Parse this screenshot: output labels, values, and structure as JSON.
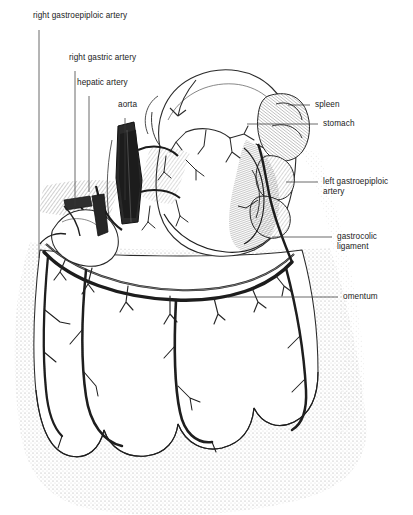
{
  "figure": {
    "style": "pen-and-ink medical illustration",
    "ink_color": "#1a1a1a",
    "background_color": "#ffffff",
    "stipple_color": "#b9b9b9"
  },
  "labels": {
    "right_gastroepiploic_artery": "right gastroepiploic artery",
    "right_gastric_artery": "right gastric artery",
    "hepatic_artery": "hepatic artery",
    "aorta": "aorta",
    "spleen": "spleen",
    "stomach": "stomach",
    "left_gastroepiploic_artery_line1": "left gastroepiploic",
    "left_gastroepiploic_artery_line2": "artery",
    "gastrocolic_ligament_line1": "gastrocolic",
    "gastrocolic_ligament_line2": "ligament",
    "omentum": "omentum"
  },
  "structures": [
    {
      "name": "stomach",
      "side": "right"
    },
    {
      "name": "spleen",
      "side": "right"
    },
    {
      "name": "omentum",
      "side": "right"
    },
    {
      "name": "gastrocolic ligament",
      "side": "right"
    },
    {
      "name": "left gastroepiploic artery",
      "side": "right"
    },
    {
      "name": "aorta",
      "side": "left"
    },
    {
      "name": "hepatic artery",
      "side": "left"
    },
    {
      "name": "right gastric artery",
      "side": "left"
    },
    {
      "name": "right gastroepiploic artery",
      "side": "left"
    }
  ]
}
